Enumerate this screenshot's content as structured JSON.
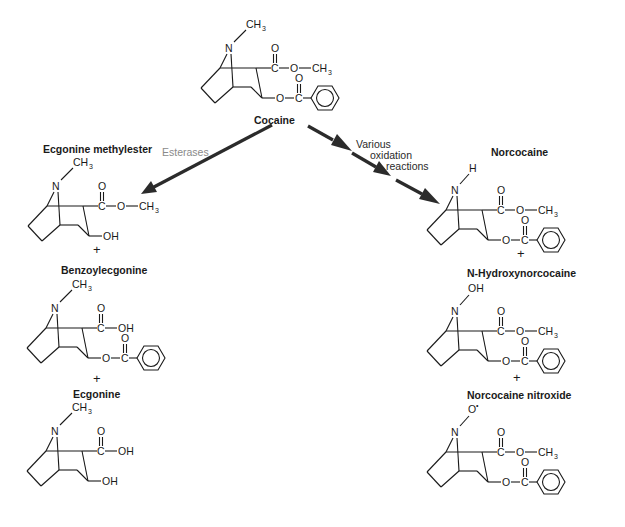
{
  "diagram": {
    "type": "metabolic-pathway",
    "colors": {
      "structure": "#1a1a1a",
      "arrow": "#2b2b2b",
      "enzyme_label": "#8a8a8a",
      "background": "#ffffff"
    }
  },
  "parent": {
    "name": "Cocaine",
    "n_substituent": "CH3",
    "ester_group": "C(=O)-O-CH3",
    "benzoyl_group": "O-C(=O)-Ph"
  },
  "pathways": [
    {
      "label": "Esterases",
      "direction": "left",
      "products": [
        {
          "name": "Ecgonine methylester",
          "n_substituent": "CH3",
          "c2_group": "C(=O)-O-CH3",
          "c3_group": "OH"
        },
        {
          "name": "Benzoylecgonine",
          "n_substituent": "CH3",
          "c2_group": "C(=O)-OH",
          "c3_group": "O-C(=O)-Ph"
        },
        {
          "name": "Ecgonine",
          "n_substituent": "CH3",
          "c2_group": "C(=O)-OH",
          "c3_group": "OH"
        }
      ]
    },
    {
      "label_lines": [
        "Various",
        "oxidation",
        "reactions"
      ],
      "direction": "right",
      "products": [
        {
          "name": "Norcocaine",
          "n_substituent": "H",
          "c2_group": "C(=O)-O-CH3",
          "c3_group": "O-C(=O)-Ph"
        },
        {
          "name": "N-Hydroxynorcocaine",
          "n_substituent": "OH",
          "c2_group": "C(=O)-O-CH3",
          "c3_group": "O-C(=O)-Ph"
        },
        {
          "name": "Norcocaine nitroxide",
          "n_substituent": "O•",
          "c2_group": "C(=O)-O-CH3",
          "c3_group": "O-C(=O)-Ph"
        }
      ]
    }
  ],
  "atoms": {
    "N": "N",
    "C": "C",
    "O": "O",
    "H": "H",
    "CH": "CH",
    "3": "3",
    "OH": "OH",
    "Orad": "O",
    "rad": "•"
  },
  "separators": {
    "plus": "+"
  }
}
